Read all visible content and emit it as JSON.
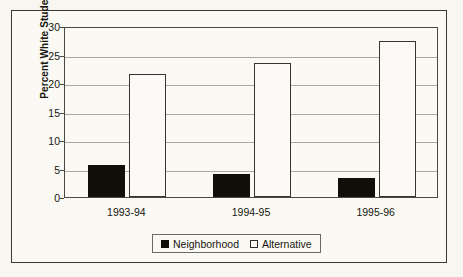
{
  "chart_data": {
    "type": "bar",
    "title": "",
    "xlabel": "",
    "ylabel": "Percent White Students",
    "categories": [
      "1993-94",
      "1994-95",
      "1995-96"
    ],
    "series": [
      {
        "name": "Neighborhood",
        "values": [
          5.6,
          4.1,
          3.4
        ],
        "color": "#100f0a",
        "swatch": "filled"
      },
      {
        "name": "Alternative",
        "values": [
          21.5,
          23.5,
          27.4
        ],
        "color": "#fbfaf6",
        "swatch": "hollow"
      }
    ],
    "ylim": [
      0,
      30
    ],
    "yticks": [
      0,
      5,
      10,
      15,
      20,
      25,
      30
    ],
    "ytick_labels": [
      "0",
      "5",
      "10",
      "15",
      "20",
      "25",
      "30"
    ],
    "grid": true,
    "legend_position": "bottom-center"
  },
  "colors": {
    "neighborhood": "#100f0a",
    "alternative": "#fbfaf6",
    "axis": "#4a4a42",
    "gridline": "#a9a9a1",
    "frame": "#3a3a33",
    "background": "#faf9f4",
    "text": "#17170f"
  }
}
